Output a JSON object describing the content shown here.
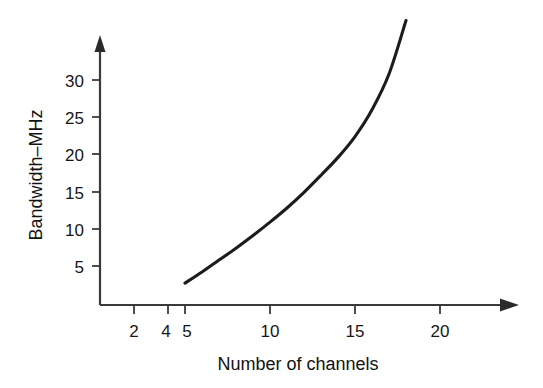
{
  "chart_data": {
    "type": "line",
    "title": "",
    "subtitle": "",
    "xlabel": "Number of channels",
    "ylabel": "Bandwidth–MHz",
    "xlim": [
      0,
      23.5
    ],
    "ylim": [
      0,
      40
    ],
    "grid": false,
    "legend": "none",
    "x_ticks": [
      2,
      4,
      5,
      10,
      15,
      20
    ],
    "x_tick_labels": [
      "2",
      "4",
      "5",
      "10",
      "15",
      "20"
    ],
    "y_ticks": [
      5,
      10,
      15,
      20,
      25,
      30
    ],
    "y_tick_labels": [
      "5",
      "10",
      "15",
      "20",
      "25",
      "30"
    ],
    "series": [
      {
        "name": "Bandwidth vs channels",
        "color": "#1c1c1c",
        "x": [
          5,
          6,
          7,
          8,
          9,
          10,
          11,
          12,
          13,
          14,
          15,
          16,
          17,
          18
        ],
        "values": [
          2.7,
          4.2,
          5.8,
          7.4,
          9.1,
          10.9,
          12.8,
          14.9,
          17.2,
          19.6,
          22.4,
          26.0,
          30.8,
          38.0
        ]
      }
    ],
    "annotations": []
  },
  "axes": {
    "x_axis_name": "x-axis",
    "y_axis_name": "y-axis",
    "x_arrow": "right-arrow",
    "y_arrow": "up-arrow"
  }
}
